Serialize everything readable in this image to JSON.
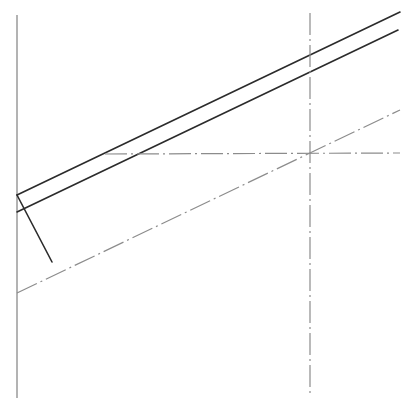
{
  "drawing": {
    "width": 413,
    "height": 402,
    "background": "#ffffff",
    "colors": {
      "object_line": "#2b2b2b",
      "reference_line": "#9a9a9a",
      "center_line": "#8c8c8c"
    },
    "lines": [
      {
        "id": "vertical-reference",
        "style": "solid-grey",
        "x1": 17,
        "y1": 15,
        "x2": 17,
        "y2": 398
      },
      {
        "id": "upper-edge",
        "style": "solid-dark",
        "x1": 17,
        "y1": 195,
        "x2": 400,
        "y2": 12
      },
      {
        "id": "lower-edge",
        "style": "solid-dark",
        "x1": 17,
        "y1": 212,
        "x2": 398,
        "y2": 30
      },
      {
        "id": "end-cap",
        "style": "solid-dark",
        "x1": 17,
        "y1": 195,
        "x2": 52,
        "y2": 262
      },
      {
        "id": "vertical-center",
        "style": "center-line",
        "x1": 310,
        "y1": 13,
        "x2": 310,
        "y2": 397
      },
      {
        "id": "horizontal-center",
        "style": "center-line",
        "x1": 105,
        "y1": 154,
        "x2": 400,
        "y2": 153
      },
      {
        "id": "diagonal-center",
        "style": "center-line",
        "x1": 17,
        "y1": 293,
        "x2": 400,
        "y2": 110
      }
    ]
  }
}
